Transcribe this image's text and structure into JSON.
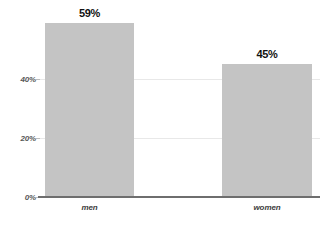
{
  "chart_data": {
    "type": "bar",
    "title": "",
    "subtitle": "",
    "xlabel": "",
    "ylabel": "",
    "categories": [
      "men",
      "women"
    ],
    "values": [
      59,
      45
    ],
    "value_labels": [
      "59%",
      "45%"
    ],
    "ylim": [
      0,
      62
    ],
    "yticks": [
      0,
      20,
      40
    ],
    "ytick_labels": [
      "0%",
      "20%",
      "40%"
    ],
    "grid": true,
    "grid_axis": "y",
    "legend": false,
    "legend_position": "none",
    "series": [
      {
        "name": "",
        "values": [
          59,
          45
        ]
      }
    ],
    "colors": {
      "bar_fill": "#c4c4c4",
      "baseline": "#6e6e6e",
      "gridline": "#e8e8e8",
      "value_label": "#111111",
      "tick_label": "#585858",
      "category_label": "#3c3c3c",
      "background": "#ffffff"
    }
  }
}
